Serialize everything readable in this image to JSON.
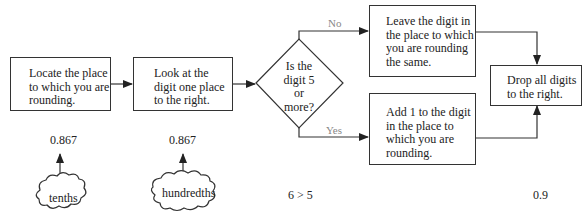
{
  "flowchart": {
    "steps": [
      {
        "id": "locate",
        "text": "Locate the place to which you are rounding."
      },
      {
        "id": "look",
        "text": "Look at the digit one place to the right."
      },
      {
        "id": "decision",
        "text": "Is the digit 5 or more?"
      },
      {
        "id": "leave",
        "text": "Leave the digit in the place to which you are rounding the same."
      },
      {
        "id": "add",
        "text": "Add 1 to the digit in the place to which you are rounding."
      },
      {
        "id": "drop",
        "text": "Drop all digits to the right."
      }
    ],
    "branch_labels": {
      "no": "No",
      "yes": "Yes"
    }
  },
  "example": {
    "number_1": "0.867",
    "number_2": "0.867",
    "cloud_1": "tenths",
    "cloud_2": "hundredths",
    "comparison": "6 > 5",
    "result": "0.9"
  }
}
